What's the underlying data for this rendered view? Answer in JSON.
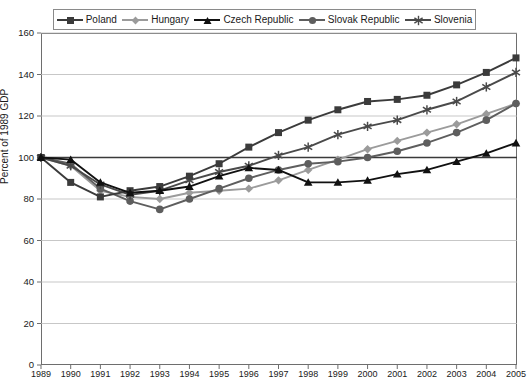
{
  "legend": {
    "position": "top",
    "items": [
      {
        "label": "Poland",
        "marker": "square-marker-icon",
        "color": "#3b3b3b"
      },
      {
        "label": "Hungary",
        "marker": "diamond-marker-icon",
        "color": "#9b9b9b"
      },
      {
        "label": "Czech Republic",
        "marker": "triangle-marker-icon",
        "color": "#111111"
      },
      {
        "label": "Slovak Republic",
        "marker": "circle-marker-icon",
        "color": "#5e5e5e"
      },
      {
        "label": "Slovenia",
        "marker": "asterisk-marker-icon",
        "color": "#4a4a4a"
      }
    ]
  },
  "axes": {
    "y_title": "Percent of 1989 GDP",
    "y_ticks": [
      "0",
      "20",
      "40",
      "60",
      "80",
      "100",
      "120",
      "140",
      "160"
    ],
    "x_ticks": [
      "1989",
      "1990",
      "1991",
      "1992",
      "1993",
      "1994",
      "1995",
      "1996",
      "1997",
      "1998",
      "1999",
      "2000",
      "2001",
      "2002",
      "2003",
      "2004",
      "2005"
    ]
  },
  "chart_data": {
    "type": "line",
    "title": "",
    "subtitle": "",
    "xlabel": "",
    "ylabel": "Percent of 1989 GDP",
    "xlim": [
      1989,
      2005
    ],
    "ylim": [
      0,
      160
    ],
    "ytick_step": 20,
    "grid": true,
    "grid_axis": "y",
    "legend_position": "top",
    "x": [
      1989,
      1990,
      1991,
      1992,
      1993,
      1994,
      1995,
      1996,
      1997,
      1998,
      1999,
      2000,
      2001,
      2002,
      2003,
      2004,
      2005
    ],
    "series": [
      {
        "name": "Poland",
        "marker": "square",
        "color": "#3b3b3b",
        "values": [
          100,
          88,
          81,
          84,
          86,
          91,
          97,
          105,
          112,
          118,
          123,
          127,
          128,
          130,
          135,
          141,
          148
        ]
      },
      {
        "name": "Hungary",
        "marker": "diamond",
        "color": "#9b9b9b",
        "values": [
          100,
          96,
          84,
          81,
          80,
          83,
          84,
          85,
          89,
          94,
          99,
          104,
          108,
          112,
          116,
          121,
          126
        ]
      },
      {
        "name": "Czech Republic",
        "marker": "triangle",
        "color": "#111111",
        "values": [
          100,
          99,
          88,
          83,
          84,
          86,
          91,
          95,
          94,
          88,
          88,
          89,
          92,
          94,
          98,
          102,
          107
        ]
      },
      {
        "name": "Slovak Republic",
        "marker": "circle",
        "color": "#5e5e5e",
        "values": [
          100,
          97,
          85,
          79,
          75,
          80,
          85,
          90,
          94,
          97,
          98,
          100,
          103,
          107,
          112,
          118,
          126
        ]
      },
      {
        "name": "Slovenia",
        "marker": "asterisk",
        "color": "#4a4a4a",
        "values": [
          100,
          96,
          87,
          82,
          84,
          89,
          93,
          96,
          101,
          105,
          111,
          115,
          118,
          123,
          127,
          134,
          141
        ]
      }
    ]
  }
}
